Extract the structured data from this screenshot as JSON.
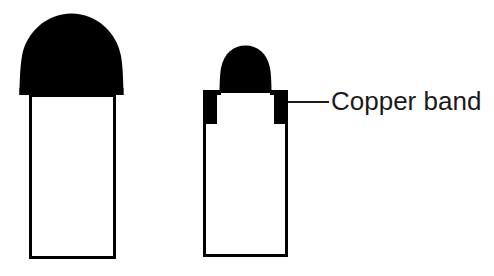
{
  "figure": {
    "type": "technical-diagram",
    "background_color": "#ffffff",
    "ink_color": "#000000",
    "text_color": "#1a1a1a",
    "panels": [
      {
        "id": "left-panel",
        "name": "unconstrained-vessel",
        "has_copper_band": false,
        "vessel": {
          "x": 29,
          "y": 94,
          "width": 86,
          "height": 164,
          "stroke_width": 3,
          "fill": "#ffffff"
        },
        "dome": {
          "center_x": 71.5,
          "base_y": 95,
          "radius_x": 52,
          "radius_y": 41,
          "fill": "#000000"
        }
      },
      {
        "id": "right-panel",
        "name": "copper-band-vessel",
        "has_copper_band": true,
        "vessel": {
          "x": 203,
          "y": 90,
          "width": 85,
          "height": 167,
          "stroke_width": 3,
          "fill": "#ffffff"
        },
        "dome": {
          "center_x": 245.5,
          "base_y": 91,
          "radius_x": 26,
          "radius_y": 23,
          "fill": "#000000"
        },
        "band": {
          "left_x": 203,
          "right_x": 274,
          "top_y": 90,
          "width": 14,
          "height": 34,
          "fill": "#000000"
        }
      }
    ],
    "callouts": [
      {
        "id": "copper-band-callout",
        "label": "Copper band",
        "leader_line": {
          "x1": 288,
          "y1": 102,
          "x2": 329,
          "y2": 102,
          "stroke_width": 2
        },
        "label_x": 331,
        "label_y": 86
      }
    ]
  }
}
